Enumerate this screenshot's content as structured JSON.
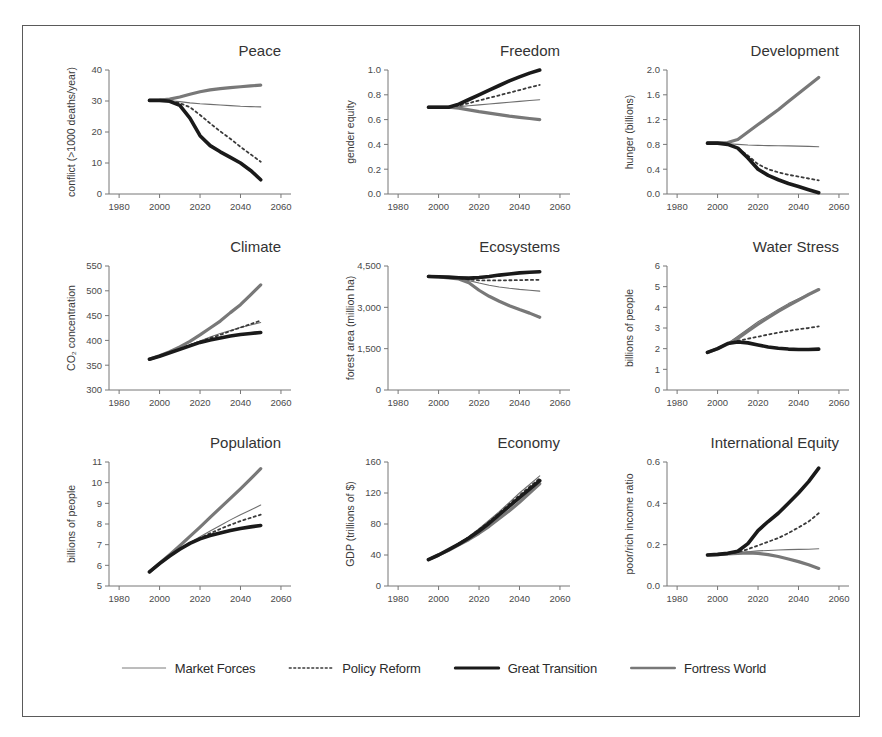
{
  "figure": {
    "title": "",
    "x_ticks": [
      1980,
      2000,
      2020,
      2040,
      2060
    ],
    "xlim": [
      1975,
      2062
    ],
    "x_start": 1995,
    "x_end": 2050
  },
  "legend": {
    "position": "bottom-center",
    "items": [
      {
        "label": "Market Forces",
        "style": "thin-solid",
        "color": "#6e6e6e",
        "width": 1.1
      },
      {
        "label": "Policy Reform",
        "style": "dotted",
        "color": "#3a3a3a",
        "width": 1.8
      },
      {
        "label": "Great Transition",
        "style": "thick-solid",
        "color": "#1a1a1a",
        "width": 3.6
      },
      {
        "label": "Fortress World",
        "style": "medium-solid",
        "color": "#787878",
        "width": 3.2
      }
    ]
  },
  "chart_data": [
    {
      "id": "peace",
      "type": "line",
      "title": "Peace",
      "xlabel": "",
      "ylabel": "conflict (>1000 deaths/year)",
      "ylim": [
        0,
        40
      ],
      "y_ticks": [
        0,
        10,
        20,
        30,
        40
      ],
      "x": [
        1995,
        2000,
        2005,
        2010,
        2015,
        2020,
        2025,
        2030,
        2035,
        2040,
        2045,
        2050
      ],
      "series": [
        {
          "name": "Market Forces",
          "values": [
            30.2,
            30.2,
            30.1,
            29.8,
            29.4,
            29.1,
            28.9,
            28.7,
            28.5,
            28.3,
            28.2,
            28.1
          ]
        },
        {
          "name": "Policy Reform",
          "values": [
            30.2,
            30.2,
            30.0,
            29.3,
            28.0,
            25.5,
            22.8,
            20.2,
            17.8,
            15.2,
            12.8,
            10.4
          ]
        },
        {
          "name": "Great Transition",
          "values": [
            30.2,
            30.2,
            29.9,
            28.6,
            24.5,
            18.8,
            15.6,
            13.6,
            11.8,
            10.0,
            7.6,
            4.6
          ]
        },
        {
          "name": "Fortress World",
          "values": [
            30.2,
            30.3,
            30.6,
            31.3,
            32.2,
            33.0,
            33.6,
            34.0,
            34.3,
            34.6,
            34.9,
            35.1
          ]
        }
      ]
    },
    {
      "id": "freedom",
      "type": "line",
      "title": "Freedom",
      "xlabel": "",
      "ylabel": "gender equity",
      "ylim": [
        0.0,
        1.0
      ],
      "y_ticks": [
        0.0,
        0.2,
        0.4,
        0.6,
        0.8,
        1.0
      ],
      "x": [
        1995,
        2000,
        2005,
        2010,
        2015,
        2020,
        2025,
        2030,
        2035,
        2040,
        2045,
        2050
      ],
      "series": [
        {
          "name": "Market Forces",
          "values": [
            0.7,
            0.7,
            0.7,
            0.705,
            0.712,
            0.719,
            0.726,
            0.733,
            0.74,
            0.747,
            0.754,
            0.76
          ]
        },
        {
          "name": "Policy Reform",
          "values": [
            0.7,
            0.7,
            0.7,
            0.712,
            0.733,
            0.754,
            0.775,
            0.796,
            0.817,
            0.838,
            0.86,
            0.88
          ]
        },
        {
          "name": "Great Transition",
          "values": [
            0.7,
            0.7,
            0.7,
            0.725,
            0.762,
            0.8,
            0.838,
            0.875,
            0.912,
            0.945,
            0.975,
            1.0
          ]
        },
        {
          "name": "Fortress World",
          "values": [
            0.7,
            0.7,
            0.7,
            0.692,
            0.678,
            0.664,
            0.652,
            0.64,
            0.628,
            0.618,
            0.609,
            0.6
          ]
        }
      ]
    },
    {
      "id": "development",
      "type": "line",
      "title": "Development",
      "xlabel": "",
      "ylabel": "hunger (billions)",
      "ylim": [
        0.0,
        2.0
      ],
      "y_ticks": [
        0.0,
        0.4,
        0.8,
        1.2,
        1.6,
        2.0
      ],
      "x": [
        1995,
        2000,
        2005,
        2010,
        2015,
        2020,
        2025,
        2030,
        2035,
        2040,
        2045,
        2050
      ],
      "series": [
        {
          "name": "Market Forces",
          "values": [
            0.82,
            0.82,
            0.81,
            0.8,
            0.79,
            0.785,
            0.78,
            0.778,
            0.776,
            0.772,
            0.768,
            0.762
          ]
        },
        {
          "name": "Policy Reform",
          "values": [
            0.82,
            0.82,
            0.8,
            0.74,
            0.62,
            0.48,
            0.4,
            0.35,
            0.31,
            0.28,
            0.25,
            0.22
          ]
        },
        {
          "name": "Great Transition",
          "values": [
            0.82,
            0.82,
            0.8,
            0.74,
            0.58,
            0.4,
            0.3,
            0.23,
            0.17,
            0.12,
            0.07,
            0.02
          ]
        },
        {
          "name": "Fortress World",
          "values": [
            0.82,
            0.82,
            0.83,
            0.88,
            1.0,
            1.12,
            1.24,
            1.36,
            1.49,
            1.62,
            1.75,
            1.88
          ]
        }
      ]
    },
    {
      "id": "climate",
      "type": "line",
      "title": "Climate",
      "xlabel": "",
      "ylabel": "CO₂ concentration",
      "ylim": [
        300,
        550
      ],
      "y_ticks": [
        300,
        350,
        400,
        450,
        500,
        550
      ],
      "x": [
        1995,
        2000,
        2005,
        2010,
        2015,
        2020,
        2025,
        2030,
        2035,
        2040,
        2045,
        2050
      ],
      "series": [
        {
          "name": "Market Forces",
          "values": [
            362,
            368,
            375,
            383,
            391,
            399,
            407,
            414,
            420,
            426,
            431,
            436
          ]
        },
        {
          "name": "Policy Reform",
          "values": [
            362,
            368,
            375,
            383,
            391,
            398,
            405,
            411,
            419,
            426,
            433,
            440
          ]
        },
        {
          "name": "Great Transition",
          "values": [
            362,
            368,
            375,
            382,
            389,
            396,
            401,
            405,
            409,
            412,
            414,
            416
          ]
        },
        {
          "name": "Fortress World",
          "values": [
            362,
            369,
            377,
            387,
            398,
            411,
            425,
            439,
            456,
            472,
            492,
            512
          ]
        }
      ]
    },
    {
      "id": "ecosystems",
      "type": "line",
      "title": "Ecosystems",
      "xlabel": "",
      "ylabel": "forest area (million ha)",
      "ylim": [
        0,
        4500
      ],
      "y_ticks": [
        0,
        1500,
        3000,
        4500
      ],
      "x": [
        1995,
        2000,
        2005,
        2010,
        2015,
        2020,
        2025,
        2030,
        2035,
        2040,
        2045,
        2050
      ],
      "series": [
        {
          "name": "Market Forces",
          "values": [
            4120,
            4105,
            4080,
            4045,
            3970,
            3880,
            3800,
            3740,
            3690,
            3650,
            3620,
            3590
          ]
        },
        {
          "name": "Policy Reform",
          "values": [
            4120,
            4105,
            4085,
            4060,
            4010,
            3980,
            3975,
            3978,
            3982,
            3988,
            3995,
            4000
          ]
        },
        {
          "name": "Great Transition",
          "values": [
            4120,
            4110,
            4095,
            4075,
            4060,
            4080,
            4120,
            4170,
            4210,
            4250,
            4275,
            4290
          ]
        },
        {
          "name": "Fortress World",
          "values": [
            4120,
            4100,
            4070,
            4030,
            3890,
            3620,
            3400,
            3220,
            3060,
            2920,
            2790,
            2640
          ]
        }
      ]
    },
    {
      "id": "water-stress",
      "type": "line",
      "title": "Water Stress",
      "xlabel": "",
      "ylabel": "billions of people",
      "ylim": [
        0,
        6
      ],
      "y_ticks": [
        0,
        1,
        2,
        3,
        4,
        5,
        6
      ],
      "x": [
        1995,
        2000,
        2005,
        2010,
        2015,
        2020,
        2025,
        2030,
        2035,
        2040,
        2045,
        2050
      ],
      "series": [
        {
          "name": "Market Forces",
          "values": [
            1.82,
            2.0,
            2.25,
            2.6,
            2.95,
            3.3,
            3.6,
            3.9,
            4.18,
            4.42,
            4.65,
            4.88
          ]
        },
        {
          "name": "Policy Reform",
          "values": [
            1.82,
            2.0,
            2.25,
            2.38,
            2.48,
            2.58,
            2.68,
            2.78,
            2.86,
            2.94,
            3.0,
            3.08
          ]
        },
        {
          "name": "Great Transition",
          "values": [
            1.82,
            2.0,
            2.25,
            2.32,
            2.28,
            2.18,
            2.08,
            2.02,
            1.98,
            1.96,
            1.96,
            1.98
          ]
        },
        {
          "name": "Fortress World",
          "values": [
            1.82,
            2.0,
            2.22,
            2.5,
            2.85,
            3.18,
            3.5,
            3.8,
            4.08,
            4.35,
            4.62,
            4.86
          ]
        }
      ]
    },
    {
      "id": "population",
      "type": "line",
      "title": "Population",
      "xlabel": "",
      "ylabel": "billions of people",
      "ylim": [
        5,
        11
      ],
      "y_ticks": [
        5,
        6,
        7,
        8,
        9,
        10,
        11
      ],
      "x": [
        1995,
        2000,
        2005,
        2010,
        2015,
        2020,
        2025,
        2030,
        2035,
        2040,
        2045,
        2050
      ],
      "series": [
        {
          "name": "Market Forces",
          "values": [
            5.68,
            6.08,
            6.45,
            6.8,
            7.1,
            7.38,
            7.66,
            7.93,
            8.2,
            8.45,
            8.68,
            8.92
          ]
        },
        {
          "name": "Policy Reform",
          "values": [
            5.68,
            6.08,
            6.45,
            6.78,
            7.08,
            7.32,
            7.55,
            7.76,
            7.96,
            8.14,
            8.3,
            8.45
          ]
        },
        {
          "name": "Great Transition",
          "values": [
            5.68,
            6.08,
            6.45,
            6.78,
            7.06,
            7.28,
            7.44,
            7.56,
            7.68,
            7.78,
            7.86,
            7.93
          ]
        },
        {
          "name": "Fortress World",
          "values": [
            5.68,
            6.1,
            6.52,
            6.95,
            7.4,
            7.85,
            8.32,
            8.78,
            9.24,
            9.7,
            10.18,
            10.68
          ]
        }
      ]
    },
    {
      "id": "economy",
      "type": "line",
      "title": "Economy",
      "xlabel": "",
      "ylabel": "GDP (trillions of $)",
      "ylim": [
        0,
        160
      ],
      "y_ticks": [
        0,
        40,
        80,
        120,
        160
      ],
      "x": [
        1995,
        2000,
        2005,
        2010,
        2015,
        2020,
        2025,
        2030,
        2035,
        2040,
        2045,
        2050
      ],
      "series": [
        {
          "name": "Market Forces",
          "values": [
            34,
            40,
            47,
            55,
            64,
            74,
            85,
            96,
            108,
            120,
            131,
            142
          ]
        },
        {
          "name": "Policy Reform",
          "values": [
            34,
            40,
            47,
            55,
            63,
            73,
            83,
            94,
            106,
            117,
            128,
            139
          ]
        },
        {
          "name": "Great Transition",
          "values": [
            34,
            40,
            47,
            54,
            62,
            71,
            81,
            92,
            103,
            114,
            125,
            136
          ]
        },
        {
          "name": "Fortress World",
          "values": [
            34,
            40,
            46,
            53,
            60,
            68,
            77,
            87,
            97,
            108,
            120,
            132
          ]
        }
      ]
    },
    {
      "id": "international-equity",
      "type": "line",
      "title": "International Equity",
      "xlabel": "",
      "ylabel": "poor/rich income ratio",
      "ylim": [
        0.0,
        0.6
      ],
      "y_ticks": [
        0.0,
        0.2,
        0.4,
        0.6
      ],
      "x": [
        1995,
        2000,
        2005,
        2010,
        2015,
        2020,
        2025,
        2030,
        2035,
        2040,
        2045,
        2050
      ],
      "series": [
        {
          "name": "Market Forces",
          "values": [
            0.15,
            0.153,
            0.157,
            0.161,
            0.166,
            0.17,
            0.172,
            0.174,
            0.176,
            0.177,
            0.178,
            0.18
          ]
        },
        {
          "name": "Policy Reform",
          "values": [
            0.15,
            0.153,
            0.157,
            0.163,
            0.178,
            0.196,
            0.214,
            0.232,
            0.256,
            0.283,
            0.312,
            0.352
          ]
        },
        {
          "name": "Great Transition",
          "values": [
            0.15,
            0.153,
            0.158,
            0.168,
            0.205,
            0.268,
            0.312,
            0.352,
            0.4,
            0.45,
            0.505,
            0.57
          ]
        },
        {
          "name": "Fortress World",
          "values": [
            0.15,
            0.152,
            0.155,
            0.158,
            0.16,
            0.158,
            0.152,
            0.143,
            0.131,
            0.118,
            0.103,
            0.085
          ]
        }
      ]
    }
  ]
}
